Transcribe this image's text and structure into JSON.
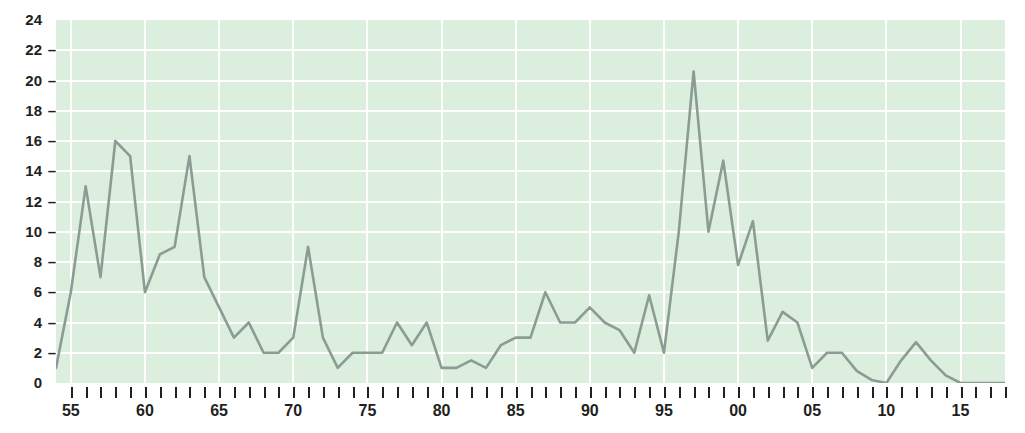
{
  "chart_data": {
    "type": "line",
    "title": "",
    "xlabel": "",
    "ylabel": "",
    "ylim": [
      0,
      24
    ],
    "ytick_values": [
      0,
      2,
      4,
      6,
      8,
      10,
      12,
      14,
      16,
      18,
      20,
      22,
      24
    ],
    "ytick_labels": [
      "0",
      "2",
      "4",
      "6",
      "8",
      "10",
      "12",
      "14",
      "16",
      "18",
      "20",
      "22",
      "24"
    ],
    "xlim": [
      1954,
      2018
    ],
    "xtick_years": [
      1955,
      1960,
      1965,
      1970,
      1975,
      1980,
      1985,
      1990,
      1995,
      2000,
      2005,
      2010,
      2015
    ],
    "xtick_labels": [
      "55",
      "60",
      "65",
      "70",
      "75",
      "80",
      "85",
      "90",
      "95",
      "00",
      "05",
      "10",
      "15"
    ],
    "grid": "horizontal-and-vertical",
    "legend": "none",
    "series": [
      {
        "name": "series-1",
        "color": "#8b9c93",
        "x": [
          1954,
          1955,
          1956,
          1957,
          1958,
          1959,
          1960,
          1961,
          1962,
          1963,
          1964,
          1965,
          1966,
          1967,
          1968,
          1969,
          1970,
          1971,
          1972,
          1973,
          1974,
          1975,
          1976,
          1977,
          1978,
          1979,
          1980,
          1981,
          1982,
          1983,
          1984,
          1985,
          1986,
          1987,
          1988,
          1989,
          1990,
          1991,
          1992,
          1993,
          1994,
          1995,
          1996,
          1997,
          1998,
          1999,
          2000,
          2001,
          2002,
          2003,
          2004,
          2005,
          2006,
          2007,
          2008,
          2009,
          2010,
          2011,
          2012,
          2013,
          2014,
          2015,
          2016,
          2017,
          2018
        ],
        "values": [
          1,
          6,
          13,
          7,
          16,
          15,
          6,
          8.5,
          9,
          15,
          7,
          5,
          3,
          4,
          2,
          2,
          3,
          9,
          3,
          1,
          2,
          2,
          2,
          4,
          2.5,
          4,
          1,
          1,
          1.5,
          1,
          2.5,
          3,
          3,
          6,
          4,
          4,
          5,
          4,
          3.5,
          2,
          5.8,
          2,
          10,
          20.6,
          10,
          14.7,
          7.8,
          10.7,
          2.8,
          4.7,
          4,
          1,
          2,
          2,
          0.8,
          0.2,
          0,
          1.5,
          2.7,
          1.5,
          0.5,
          0,
          0,
          0,
          0
        ]
      }
    ]
  },
  "axes": {
    "y_dash": "–"
  }
}
